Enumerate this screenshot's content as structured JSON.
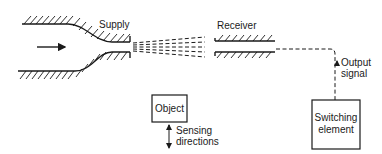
{
  "diagram": {
    "type": "pneumatic through-beam sensor schematic",
    "labels": {
      "supply": "Supply",
      "receiver": "Receiver",
      "output_signal_line1": "Output",
      "output_signal_line2": "signal",
      "object": "Object",
      "sensing_line1": "Sensing",
      "sensing_line2": "directions",
      "switching_line1": "Switching",
      "switching_line2": "element"
    },
    "nodes": [
      {
        "id": "supply",
        "label": "Supply",
        "shape": "converging nozzle"
      },
      {
        "id": "receiver",
        "label": "Receiver",
        "shape": "tube"
      },
      {
        "id": "object",
        "label": "Object",
        "shape": "box"
      },
      {
        "id": "switching",
        "label": "Switching element",
        "shape": "box"
      }
    ],
    "edges": [
      {
        "from": "supply",
        "to": "receiver",
        "style": "dashed beam"
      },
      {
        "from": "receiver",
        "to": "switching",
        "style": "dashed",
        "label": "Output signal"
      },
      {
        "from": "object",
        "to": "object",
        "style": "double arrow",
        "label": "Sensing directions"
      }
    ],
    "colors": {
      "line": "#1a1a1a",
      "background": "#ffffff"
    }
  }
}
